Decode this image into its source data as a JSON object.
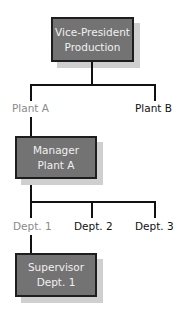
{
  "diagram": {
    "type": "org-chart",
    "colors": {
      "box_fill": "#737373",
      "box_border": "#1e1e1e",
      "shadow": "#cfcfcf",
      "box_text": "#f0f0f0",
      "connector": "#111111",
      "active_label": "#8a8a8a",
      "inactive_label": "#111111"
    },
    "nodes": {
      "vp": {
        "line1": "Vice-President",
        "line2": "Production"
      },
      "manager": {
        "line1": "Manager",
        "line2": "Plant A"
      },
      "supervisor": {
        "line1": "Supervisor",
        "line2": "Dept. 1"
      }
    },
    "level1_labels": [
      {
        "text": "Plant A",
        "highlighted": true
      },
      {
        "text": "Plant B",
        "highlighted": false
      }
    ],
    "level2_labels": [
      {
        "text": "Dept. 1",
        "highlighted": true
      },
      {
        "text": "Dept. 2",
        "highlighted": false
      },
      {
        "text": "Dept. 3",
        "highlighted": false
      }
    ]
  }
}
